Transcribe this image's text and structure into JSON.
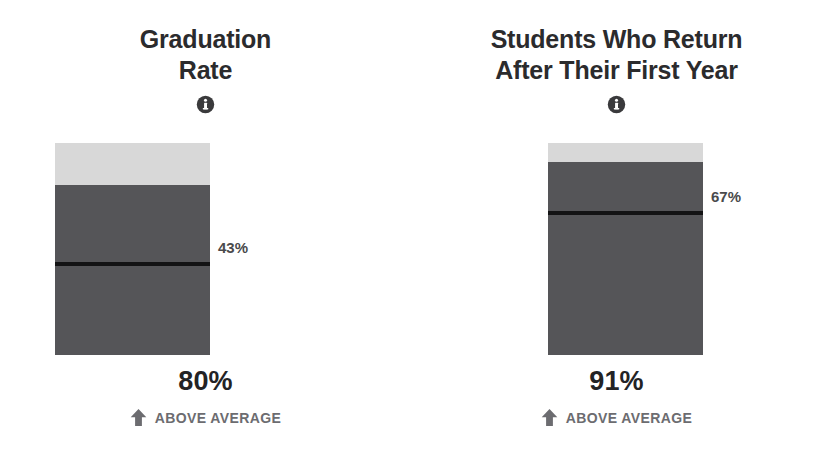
{
  "chart_data": {
    "type": "bar",
    "orientation": "vertical",
    "ylim": [
      0,
      100
    ],
    "ylabel": "Percent",
    "grid": false,
    "legend": null,
    "categories": [
      "Graduation Rate",
      "Students Who Return After Their First Year"
    ],
    "values": [
      80,
      91
    ],
    "series": [
      {
        "name": "School value",
        "values": [
          80,
          91
        ]
      },
      {
        "name": "National average (reference line)",
        "values": [
          43,
          67
        ]
      }
    ],
    "annotations": [
      {
        "category": "Graduation Rate",
        "value": 80,
        "value_label": "80%",
        "reference": 43,
        "reference_label": "43%",
        "comparison": "ABOVE AVERAGE"
      },
      {
        "category": "Students Who Return After Their First Year",
        "value": 91,
        "value_label": "91%",
        "reference": 67,
        "reference_label": "67%",
        "comparison": "ABOVE AVERAGE"
      }
    ]
  },
  "colors": {
    "track": "#d8d8d8",
    "fill": "#555558",
    "marker": "#131314",
    "title": "#2b2b2d",
    "value": "#232325",
    "compare": "#6c6c70",
    "background": "#ffffff"
  },
  "panels": [
    {
      "title": "Graduation\nRate",
      "info_icon": "info-icon",
      "fill_percent": 80,
      "fill_percent_label": "80%",
      "marker_percent": 43,
      "marker_label": "43%",
      "comparison_icon": "arrow-up-icon",
      "comparison_label": "ABOVE AVERAGE"
    },
    {
      "title": "Students Who Return\nAfter Their First Year",
      "info_icon": "info-icon",
      "fill_percent": 91,
      "fill_percent_label": "91%",
      "marker_percent": 67,
      "marker_label": "67%",
      "comparison_icon": "arrow-up-icon",
      "comparison_label": "ABOVE AVERAGE"
    }
  ]
}
